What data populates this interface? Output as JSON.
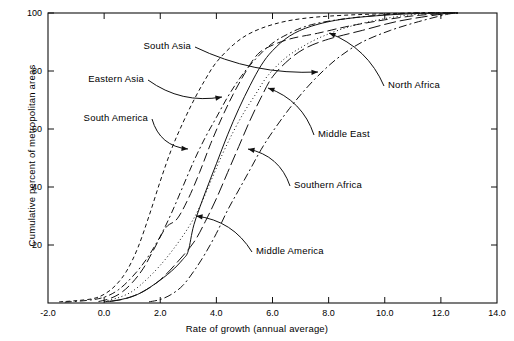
{
  "figure": {
    "title": "",
    "x_axis_title": "Rate of growth (annual average)",
    "y_axis_title": "Cumulative percent of metropolitan areas"
  },
  "annotations": [
    {
      "name": "south-asia",
      "label": "South Asia"
    },
    {
      "name": "eastern-asia",
      "label": "Eastern Asia"
    },
    {
      "name": "south-america",
      "label": "South America"
    },
    {
      "name": "north-africa",
      "label": "North Africa"
    },
    {
      "name": "middle-east",
      "label": "Middle East"
    },
    {
      "name": "southern-africa",
      "label": "Southern Africa"
    },
    {
      "name": "middle-america",
      "label": "Middle America"
    }
  ],
  "chart_data": {
    "type": "line",
    "title": "",
    "xlabel": "Rate of growth (annual average)",
    "ylabel": "Cumulative percent of metropolitan areas",
    "xlim": [
      -2.0,
      14.0
    ],
    "ylim": [
      0,
      100
    ],
    "xticks": [
      -2.0,
      0.0,
      2.0,
      4.0,
      6.0,
      8.0,
      10.0,
      12.0,
      14.0
    ],
    "xtick_labels": [
      "-2.0",
      "0.0",
      "2.0",
      "4.0",
      "6.0",
      "8.0",
      "10.0",
      "12.0",
      "14.0"
    ],
    "yticks": [
      20,
      40,
      60,
      80,
      100
    ],
    "ytick_labels": [
      "20",
      "40",
      "60",
      "80",
      "100"
    ],
    "grid": false,
    "legend": "annotated-inline",
    "stroke_color": "#111111",
    "series": [
      {
        "name": "Eastern Asia",
        "dash": "4,3",
        "points": [
          [
            -1.6,
            0.4
          ],
          [
            -1.0,
            0.8
          ],
          [
            -0.4,
            1.5
          ],
          [
            0.0,
            3.0
          ],
          [
            0.4,
            6.0
          ],
          [
            0.8,
            11.0
          ],
          [
            1.2,
            19.0
          ],
          [
            1.6,
            30.0
          ],
          [
            2.0,
            42.0
          ],
          [
            2.4,
            53.0
          ],
          [
            2.8,
            62.0
          ],
          [
            3.2,
            70.0
          ],
          [
            3.6,
            77.0
          ],
          [
            4.0,
            83.0
          ],
          [
            4.6,
            89.0
          ],
          [
            5.2,
            93.0
          ],
          [
            6.0,
            96.0
          ],
          [
            7.0,
            98.0
          ],
          [
            8.5,
            99.2
          ],
          [
            11.0,
            100.0
          ],
          [
            12.6,
            100.0
          ]
        ]
      },
      {
        "name": "South Asia",
        "dash": "9,4",
        "points": [
          [
            -0.2,
            0.5
          ],
          [
            0.2,
            1.5
          ],
          [
            0.6,
            3.5
          ],
          [
            1.0,
            7.0
          ],
          [
            1.4,
            12.0
          ],
          [
            1.8,
            19.0
          ],
          [
            2.2,
            26.0
          ],
          [
            2.6,
            29.0
          ],
          [
            3.0,
            36.0
          ],
          [
            3.4,
            45.0
          ],
          [
            3.8,
            55.0
          ],
          [
            4.2,
            64.0
          ],
          [
            4.6,
            72.0
          ],
          [
            5.0,
            79.0
          ],
          [
            5.4,
            85.0
          ],
          [
            5.8,
            88.0
          ],
          [
            6.6,
            91.0
          ],
          [
            7.6,
            93.0
          ],
          [
            9.0,
            96.0
          ],
          [
            11.0,
            99.0
          ],
          [
            12.6,
            100.0
          ]
        ]
      },
      {
        "name": "South America",
        "dash": "7,3,2,3",
        "points": [
          [
            -1.4,
            0.3
          ],
          [
            -0.6,
            0.9
          ],
          [
            0.0,
            2.0
          ],
          [
            0.5,
            4.5
          ],
          [
            1.0,
            9.0
          ],
          [
            1.5,
            15.0
          ],
          [
            2.0,
            23.0
          ],
          [
            2.4,
            31.0
          ],
          [
            2.8,
            40.0
          ],
          [
            3.2,
            49.0
          ],
          [
            3.6,
            57.0
          ],
          [
            4.0,
            64.0
          ],
          [
            4.4,
            71.0
          ],
          [
            4.8,
            77.0
          ],
          [
            5.2,
            82.0
          ],
          [
            5.8,
            88.0
          ],
          [
            6.4,
            92.0
          ],
          [
            7.4,
            96.0
          ],
          [
            9.0,
            98.5
          ],
          [
            11.0,
            100.0
          ],
          [
            12.6,
            100.0
          ]
        ]
      },
      {
        "name": "Middle East",
        "dash": "1,2.6",
        "points": [
          [
            0.0,
            0.6
          ],
          [
            0.5,
            1.8
          ],
          [
            1.0,
            4.0
          ],
          [
            1.5,
            8.0
          ],
          [
            2.0,
            13.0
          ],
          [
            2.5,
            19.0
          ],
          [
            3.0,
            26.0
          ],
          [
            3.4,
            33.0
          ],
          [
            3.8,
            42.0
          ],
          [
            4.2,
            51.0
          ],
          [
            4.6,
            59.0
          ],
          [
            5.0,
            66.0
          ],
          [
            5.4,
            72.0
          ],
          [
            5.8,
            78.0
          ],
          [
            6.4,
            84.0
          ],
          [
            7.0,
            88.0
          ],
          [
            7.8,
            92.0
          ],
          [
            9.0,
            96.0
          ],
          [
            10.6,
            99.0
          ],
          [
            12.0,
            100.0
          ],
          [
            12.6,
            100.0
          ]
        ]
      },
      {
        "name": "Southern Africa",
        "dash": "8,3,2,3",
        "points": [
          [
            1.6,
            0.4
          ],
          [
            2.0,
            1.2
          ],
          [
            2.4,
            3.0
          ],
          [
            2.8,
            6.0
          ],
          [
            3.2,
            11.0
          ],
          [
            3.6,
            17.0
          ],
          [
            4.0,
            24.0
          ],
          [
            4.4,
            32.0
          ],
          [
            4.8,
            39.0
          ],
          [
            5.2,
            46.0
          ],
          [
            5.6,
            53.0
          ],
          [
            6.0,
            59.0
          ],
          [
            6.6,
            67.0
          ],
          [
            7.2,
            74.0
          ],
          [
            7.8,
            80.0
          ],
          [
            8.4,
            85.0
          ],
          [
            9.2,
            90.0
          ],
          [
            10.2,
            94.0
          ],
          [
            11.2,
            97.0
          ],
          [
            12.2,
            99.5
          ],
          [
            12.6,
            100.0
          ]
        ]
      },
      {
        "name": "Middle America",
        "dash": "none",
        "points": [
          [
            0.0,
            0.4
          ],
          [
            0.6,
            1.2
          ],
          [
            1.2,
            3.0
          ],
          [
            1.8,
            6.5
          ],
          [
            2.4,
            11.0
          ],
          [
            2.8,
            15.0
          ],
          [
            3.0,
            18.0
          ],
          [
            3.2,
            27.0
          ],
          [
            3.6,
            38.0
          ],
          [
            4.0,
            48.0
          ],
          [
            4.4,
            58.0
          ],
          [
            4.8,
            67.0
          ],
          [
            5.2,
            75.0
          ],
          [
            5.6,
            82.0
          ],
          [
            6.0,
            87.0
          ],
          [
            6.6,
            92.0
          ],
          [
            7.4,
            95.5
          ],
          [
            8.6,
            98.0
          ],
          [
            10.4,
            99.5
          ],
          [
            12.0,
            100.0
          ],
          [
            12.6,
            100.0
          ]
        ]
      },
      {
        "name": "North Africa",
        "dash": "12,4",
        "points": [
          [
            0.2,
            0.5
          ],
          [
            0.8,
            1.6
          ],
          [
            1.4,
            4.0
          ],
          [
            2.0,
            8.0
          ],
          [
            2.6,
            14.0
          ],
          [
            3.2,
            21.0
          ],
          [
            3.6,
            28.0
          ],
          [
            4.0,
            36.0
          ],
          [
            4.4,
            45.0
          ],
          [
            4.8,
            54.0
          ],
          [
            5.2,
            63.0
          ],
          [
            5.6,
            71.0
          ],
          [
            6.0,
            78.0
          ],
          [
            6.6,
            84.0
          ],
          [
            7.2,
            88.0
          ],
          [
            8.0,
            91.0
          ],
          [
            9.2,
            94.0
          ],
          [
            10.4,
            97.0
          ],
          [
            11.6,
            99.0
          ],
          [
            12.4,
            100.0
          ],
          [
            12.6,
            100.0
          ]
        ]
      }
    ],
    "arrow_callouts": [
      {
        "label": "South Asia",
        "text_xy": [
          195,
          47
        ],
        "target_xy": [
          318,
          72
        ]
      },
      {
        "label": "Eastern Asia",
        "text_xy": [
          148,
          80
        ],
        "target_xy": [
          222,
          97
        ]
      },
      {
        "label": "South America",
        "text_xy": [
          152,
          119
        ],
        "target_xy": [
          188,
          149
        ]
      },
      {
        "label": "North Africa",
        "text_xy": [
          384,
          86
        ],
        "target_xy": [
          329,
          33
        ]
      },
      {
        "label": "Middle East",
        "text_xy": [
          314,
          135
        ],
        "target_xy": [
          268,
          88
        ]
      },
      {
        "label": "Southern Africa",
        "text_xy": [
          290,
          186
        ],
        "target_xy": [
          248,
          149
        ]
      },
      {
        "label": "Middle America",
        "text_xy": [
          252,
          252
        ],
        "target_xy": [
          196,
          216
        ]
      }
    ]
  }
}
